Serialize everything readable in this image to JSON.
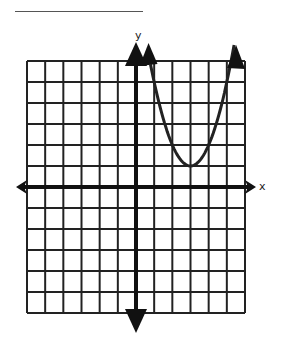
{
  "answer_blank": {
    "visible": true
  },
  "chart_data": {
    "type": "line",
    "title": "",
    "xlabel": "x",
    "ylabel": "y",
    "xlim": [
      -6,
      6
    ],
    "ylim": [
      -6,
      6
    ],
    "grid": true,
    "grid_step": 1,
    "axes_arrows": true,
    "series": [
      {
        "name": "parabola",
        "equation": "y = (x - 3)^2 + 1",
        "vertex": [
          3,
          1
        ],
        "x": [
          0.8,
          1,
          1.5,
          2,
          2.5,
          3,
          3.5,
          4,
          4.5,
          5,
          5.4
        ],
        "values": [
          5.84,
          5,
          3.25,
          2,
          1.25,
          1,
          1.25,
          2,
          3.25,
          5,
          6.76
        ],
        "arrows_on_ends": true,
        "color": "#222222"
      }
    ]
  },
  "labels": {
    "x_axis": "x",
    "y_axis": "y"
  }
}
